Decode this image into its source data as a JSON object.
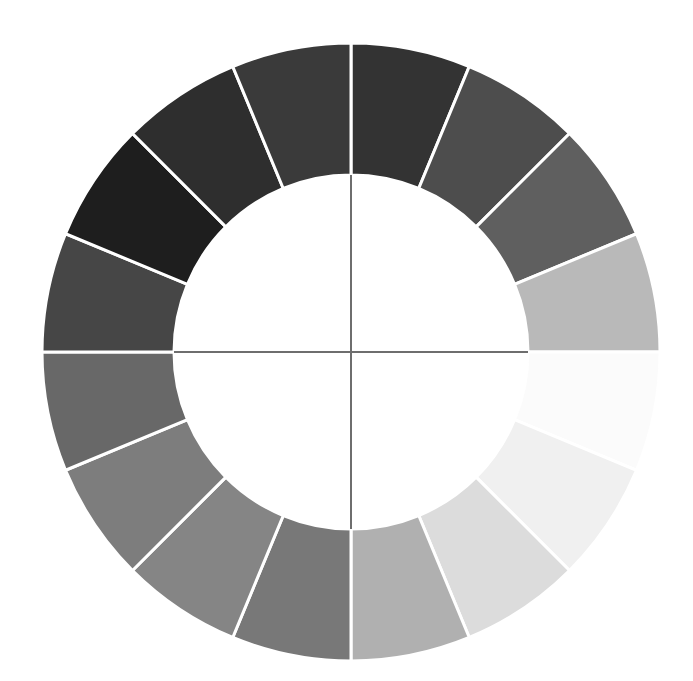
{
  "figure": {
    "name": "grayscale-value-wheel",
    "background_color": "#ffffff",
    "separator_color": "#ffffff",
    "axis_color": "#6e6e6e"
  },
  "geometry": {
    "center_x": 351,
    "center_y": 352,
    "outer_radius": 309,
    "inner_radius": 177,
    "sector_count": 16,
    "sector_span_degrees": 22.5,
    "start_angle_degrees": -90
  },
  "axes": {
    "vertical": {
      "label": "vertical-axis",
      "x1": 351,
      "y1": 175,
      "x2": 351,
      "y2": 529
    },
    "horizontal": {
      "label": "horizontal-axis",
      "x1": 174,
      "y1": 352,
      "x2": 528,
      "y2": 352
    }
  },
  "chart_data": {
    "type": "pie",
    "subtitle": "",
    "xlabel": "",
    "ylabel": "",
    "legend_position": "none",
    "grid": false,
    "hole_ratio": 0.573,
    "categories": [
      "V5",
      "V4",
      "V3",
      "V2",
      "V1",
      "V1.5",
      "V2.5",
      "V3.5",
      "V4.5",
      "V5.5",
      "V6.5",
      "V7.5",
      "V8.5",
      "V9",
      "V8",
      "V6.5b"
    ],
    "values": [
      22.5,
      22.5,
      22.5,
      22.5,
      22.5,
      22.5,
      22.5,
      22.5,
      22.5,
      22.5,
      22.5,
      22.5,
      22.5,
      22.5,
      22.5,
      22.5
    ],
    "colors": [
      "#4f4f4f",
      "#5b5b5b",
      "#6e6e6e",
      "#7a7a7a",
      "#8d8d8d",
      "#b4b4b4",
      "#d8d8d8",
      "#ededed",
      "#fafafa",
      "#fdfdfd",
      "#f2f2f2",
      "#c8c8c8",
      "#a2a2a2",
      "#6a6a6a",
      "#3c3c3c",
      "#2b2b2b"
    ],
    "sectors": [
      {
        "index": 0,
        "label": "sector-00",
        "start_deg": -90.0,
        "end_deg": -67.5,
        "color": "#333333",
        "value_step": 3
      },
      {
        "index": 1,
        "label": "sector-01",
        "start_deg": -67.5,
        "end_deg": -45.0,
        "color": "#4d4d4d",
        "value_step": 4
      },
      {
        "index": 2,
        "label": "sector-02",
        "start_deg": -45.0,
        "end_deg": -22.5,
        "color": "#5f5f5f",
        "value_step": 5
      },
      {
        "index": 3,
        "label": "sector-03",
        "start_deg": -22.5,
        "end_deg": 0.0,
        "color": "#b9b9b9",
        "value_step": 7
      },
      {
        "index": 4,
        "label": "sector-04",
        "start_deg": 0.0,
        "end_deg": 22.5,
        "color": "#fbfbfb",
        "value_step": 9
      },
      {
        "index": 5,
        "label": "sector-05",
        "start_deg": 22.5,
        "end_deg": 45.0,
        "color": "#f0f0f0",
        "value_step": 9
      },
      {
        "index": 6,
        "label": "sector-06",
        "start_deg": 45.0,
        "end_deg": 67.5,
        "color": "#dcdcdc",
        "value_step": 8
      },
      {
        "index": 7,
        "label": "sector-07",
        "start_deg": 67.5,
        "end_deg": 90.0,
        "color": "#b0b0b0",
        "value_step": 7
      },
      {
        "index": 8,
        "label": "sector-08",
        "start_deg": 90.0,
        "end_deg": 112.5,
        "color": "#787878",
        "value_step": 5
      },
      {
        "index": 9,
        "label": "sector-09",
        "start_deg": 112.5,
        "end_deg": 135.0,
        "color": "#858585",
        "value_step": 5
      },
      {
        "index": 10,
        "label": "sector-10",
        "start_deg": 135.0,
        "end_deg": 157.5,
        "color": "#7d7d7d",
        "value_step": 5
      },
      {
        "index": 11,
        "label": "sector-11",
        "start_deg": 157.5,
        "end_deg": 180.0,
        "color": "#686868",
        "value_step": 4
      },
      {
        "index": 12,
        "label": "sector-12",
        "start_deg": 180.0,
        "end_deg": 202.5,
        "color": "#464646",
        "value_step": 3
      },
      {
        "index": 13,
        "label": "sector-13",
        "start_deg": 202.5,
        "end_deg": 225.0,
        "color": "#1e1e1e",
        "value_step": 1
      },
      {
        "index": 14,
        "label": "sector-14",
        "start_deg": 225.0,
        "end_deg": 247.5,
        "color": "#2e2e2e",
        "value_step": 2
      },
      {
        "index": 15,
        "label": "sector-15",
        "start_deg": 247.5,
        "end_deg": 270.0,
        "color": "#3a3a3a",
        "value_step": 2
      }
    ]
  }
}
